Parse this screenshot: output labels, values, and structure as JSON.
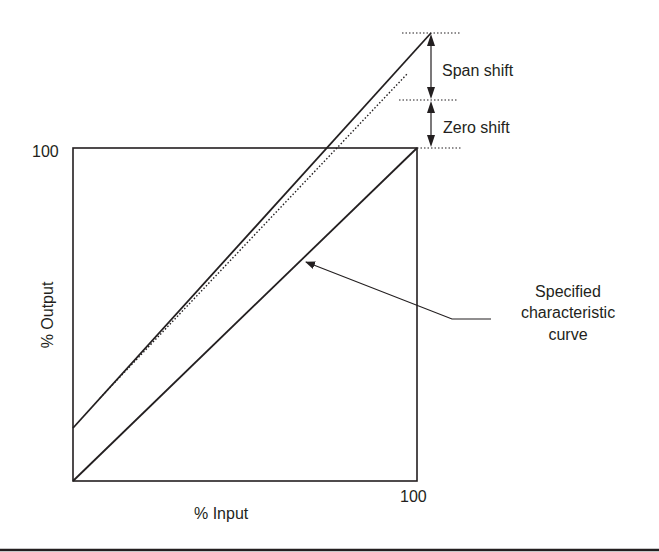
{
  "diagram": {
    "y_axis_label": "% Output",
    "x_axis_label": "% Input",
    "y_max_label": "100",
    "x_max_label": "100",
    "annotations": {
      "span_shift": "Span shift",
      "zero_shift": "Zero shift",
      "callout_line1": "Specified",
      "callout_line2": "characteristic",
      "callout_line3": "curve"
    },
    "colors": {
      "ink": "#231f20",
      "background": "#ffffff"
    }
  }
}
